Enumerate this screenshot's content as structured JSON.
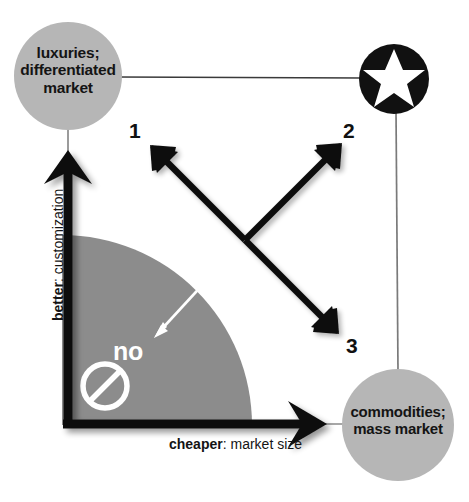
{
  "diagram": {
    "background_color": "#ffffff",
    "axes": {
      "x": {
        "emphasis": "cheaper",
        "rest": ": market size",
        "arrow_color": "#000000"
      },
      "y": {
        "emphasis": "better",
        "rest": ": customization",
        "arrow_color": "#000000"
      }
    },
    "nodes": [
      {
        "id": "luxuries",
        "label": "luxuries;\ndifferentiated\nmarket",
        "shape": "circle",
        "fill": "#b6b6b6",
        "text_color": "#141414",
        "cx": 68,
        "cy": 76,
        "r": 54
      },
      {
        "id": "star",
        "label": "",
        "shape": "circle-star",
        "fill": "#111111",
        "star_color": "#ffffff",
        "cx": 394,
        "cy": 79,
        "r": 35
      },
      {
        "id": "commodities",
        "label": "commodities;\nmass market",
        "shape": "circle",
        "fill": "#b6b6b6",
        "text_color": "#141414",
        "cx": 398,
        "cy": 425,
        "r": 56
      }
    ],
    "connectors": [
      {
        "id": "luxuries-to-star",
        "from": "luxuries",
        "to": "star",
        "color": "#3a3a3a"
      },
      {
        "id": "star-to-commodities",
        "from": "star",
        "to": "commodities",
        "color": "#6d6d6d"
      },
      {
        "id": "luxuries-to-y-axis",
        "from": "luxuries",
        "to": "y-axis-arrow",
        "color": "#6d6d6d"
      },
      {
        "id": "x-axis-to-commodities",
        "from": "x-axis-arrow",
        "to": "commodities",
        "color": "#6d6d6d"
      }
    ],
    "no_zone": {
      "label": "no",
      "fill": "#8c8c8c",
      "text_color": "#ffffff",
      "icon": "prohibition-icon",
      "radius": 190,
      "description": "shaded quarter-disc near origin marked no"
    },
    "arrows": [
      {
        "id": "1",
        "label": "1",
        "direction": "up-left",
        "color": "#111111"
      },
      {
        "id": "2",
        "label": "2",
        "direction": "up-right",
        "color": "#111111"
      },
      {
        "id": "3",
        "label": "3",
        "direction": "down-right",
        "color": "#111111"
      },
      {
        "id": "no-arrow",
        "label": "",
        "direction": "down-left",
        "color": "#ffffff"
      }
    ],
    "colors": {
      "node_gray": "#b6b6b6",
      "zone_gray": "#8c8c8c",
      "ink": "#111111",
      "white": "#ffffff"
    }
  }
}
